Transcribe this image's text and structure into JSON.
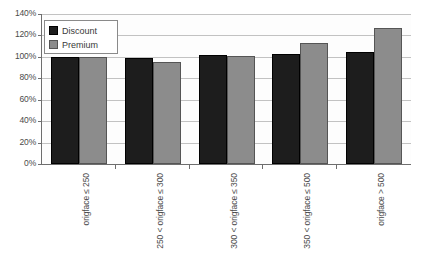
{
  "chart_data": {
    "type": "bar",
    "title": "",
    "subtitle": "",
    "xlabel": "",
    "ylabel": "",
    "categories": [
      "origface ≤ 250",
      "250 < origface ≤ 300",
      "300 < origface ≤ 350",
      "350 < origface ≤ 500",
      "origface > 500"
    ],
    "series": [
      {
        "name": "Discount",
        "color": "#1d1d1d",
        "values": [
          100,
          99,
          102,
          103,
          105
        ]
      },
      {
        "name": "Premium",
        "color": "#8c8c8c",
        "values": [
          100,
          95,
          101,
          113,
          127
        ]
      }
    ],
    "ylim": [
      0,
      140
    ],
    "ytick_values": [
      0,
      20,
      40,
      60,
      80,
      100,
      120,
      140
    ],
    "ytick_labels": [
      "0%",
      "20%",
      "40%",
      "60%",
      "80%",
      "100%",
      "120%",
      "140%"
    ],
    "grid": true,
    "legend_position": "upper-left"
  },
  "legend": {
    "items": [
      {
        "label": "Discount",
        "swatch": "discount-swatch"
      },
      {
        "label": "Premium",
        "swatch": "premium-swatch"
      }
    ]
  }
}
